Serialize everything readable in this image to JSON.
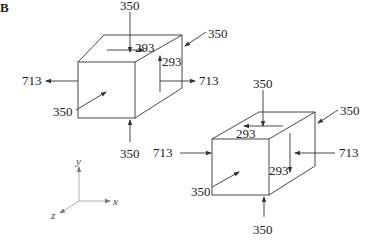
{
  "figure": {
    "label": "B"
  },
  "box1": {
    "top_load": "350",
    "top_shear": "293",
    "right_shear": "293",
    "back_load": "350",
    "left_load": "713",
    "right_load": "713",
    "front_load": "350",
    "bottom_load": "350"
  },
  "box2": {
    "top_load": "350",
    "top_shear": "293",
    "back_load": "350",
    "left_load": "713",
    "right_load": "713",
    "right_shear": "293",
    "front_load": "350",
    "bottom_load": "350"
  },
  "axes": {
    "y_label": "y",
    "x_label": "x",
    "z_label": "z"
  }
}
